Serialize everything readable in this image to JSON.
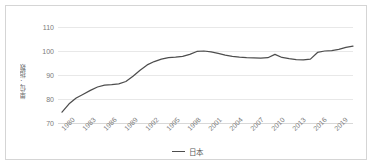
{
  "chart_data": {
    "type": "line",
    "title": "",
    "xlabel": "",
    "ylabel": "単位：指数",
    "ylim": [
      70,
      110
    ],
    "yticks": [
      70,
      80,
      90,
      100,
      110
    ],
    "xticks": [
      "1980",
      "1983",
      "1986",
      "1989",
      "1992",
      "1995",
      "1998",
      "2001",
      "2004",
      "2007",
      "2010",
      "2013",
      "2016",
      "2019"
    ],
    "grid": true,
    "legend_position": "bottom",
    "series": [
      {
        "name": "日本",
        "color": "#4d4d4d",
        "x": [
          1980,
          1981,
          1982,
          1983,
          1984,
          1985,
          1986,
          1987,
          1988,
          1989,
          1990,
          1991,
          1992,
          1993,
          1994,
          1995,
          1996,
          1997,
          1998,
          1999,
          2000,
          2001,
          2002,
          2003,
          2004,
          2005,
          2006,
          2007,
          2008,
          2009,
          2010,
          2011,
          2012,
          2013,
          2014,
          2015,
          2016,
          2017,
          2018,
          2019,
          2020,
          2021
        ],
        "values": [
          74.5,
          78.0,
          80.4,
          82.0,
          83.6,
          85.0,
          85.8,
          86.0,
          86.3,
          87.3,
          89.5,
          92.0,
          94.2,
          95.6,
          96.6,
          97.2,
          97.4,
          97.8,
          98.6,
          99.8,
          100.0,
          99.6,
          99.0,
          98.3,
          97.8,
          97.4,
          97.2,
          97.1,
          97.0,
          97.2,
          98.6,
          97.3,
          96.8,
          96.4,
          96.3,
          96.6,
          99.4,
          100.0,
          100.2,
          100.7,
          101.5,
          102.0
        ]
      }
    ]
  },
  "legend": {
    "entries": [
      {
        "label": "日本",
        "marker": "line-marker"
      }
    ]
  }
}
